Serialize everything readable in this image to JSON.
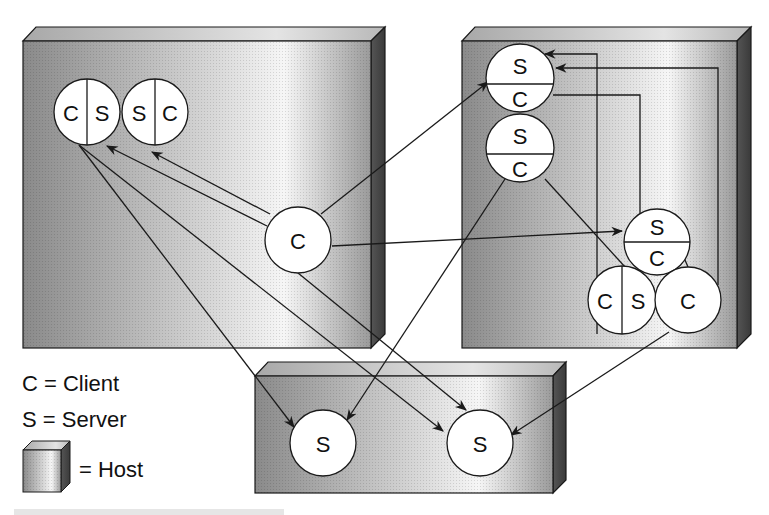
{
  "diagram": {
    "type": "client-server-host-network",
    "hosts": [
      {
        "id": "host-left",
        "label": ""
      },
      {
        "id": "host-right",
        "label": ""
      },
      {
        "id": "host-bottom",
        "label": ""
      }
    ],
    "nodes": {
      "left_cs_1": {
        "left": "C",
        "right": "S"
      },
      "left_sc_2": {
        "left": "S",
        "right": "C"
      },
      "left_center_c": "C",
      "right_top_1": {
        "top": "S",
        "bottom": "C"
      },
      "right_top_2": {
        "top": "S",
        "bottom": "C"
      },
      "right_mid": {
        "top": "S",
        "bottom": "C"
      },
      "right_bottom_cs": {
        "left": "C",
        "right": "S"
      },
      "right_bottom_c": "C",
      "bottom_s_1": "S",
      "bottom_s_2": "S"
    },
    "legend": {
      "client": "C = Client",
      "server": "S = Server",
      "host": "= Host"
    },
    "colors": {
      "line": "#1a1a1a",
      "node_fill": "#ffffff",
      "host_dark": "#7a7a7a",
      "host_light": "#f4f4f4",
      "host_side": "#4a4a4a"
    }
  }
}
